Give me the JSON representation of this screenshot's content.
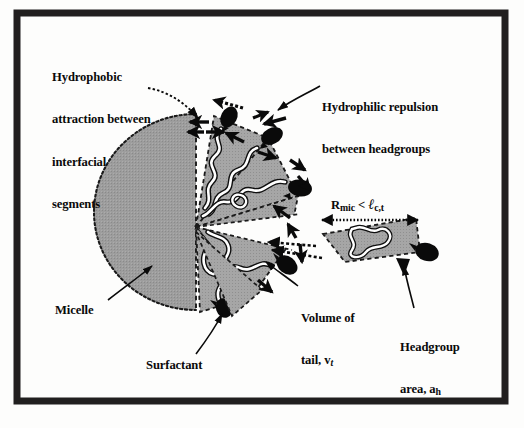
{
  "figure": {
    "type": "scientific-diagram",
    "background_color": "#fdfdfc",
    "frame_color": "#211f1f",
    "micelle_fill": "#9a9a9a",
    "headgroup_color": "#0a0a0a",
    "tail_color": "#ffffff",
    "arrow_color": "#0a0a0a"
  },
  "labels": {
    "hydrophobic": {
      "line1": "Hydrophobic",
      "line2": "attraction between",
      "line3": "interfacial",
      "line4": "segments"
    },
    "hydrophilic": {
      "line1": "Hydrophilic repulsion",
      "line2": "between headgroups"
    },
    "micelle": "Micelle",
    "surfactant": "Surfactant",
    "volume_of_tail": {
      "line1": "Volume of",
      "line2_prefix": "tail, v",
      "line2_sub": "t"
    },
    "headgroup_area": {
      "line1": "Headgroup",
      "line2_prefix": "area, a",
      "line2_sub": "h"
    },
    "radius_relation": {
      "symbol_r": "R",
      "symbol_r_sub": "mic",
      "operator": " < ",
      "symbol_l": "ℓ",
      "symbol_l_sub": "c,t"
    }
  },
  "diagram_elements": {
    "micelle_core": "gray shaded circle with dotted outline",
    "wedges": "dashed radial sectors representing surfactant molecules",
    "headgroups": "black teardrop shapes on micelle surface",
    "tails": "white wavy chains inside wedges",
    "detached_wedges": 2,
    "dimension_arrow": "double-headed horizontal arrow spanning micelle radius"
  }
}
